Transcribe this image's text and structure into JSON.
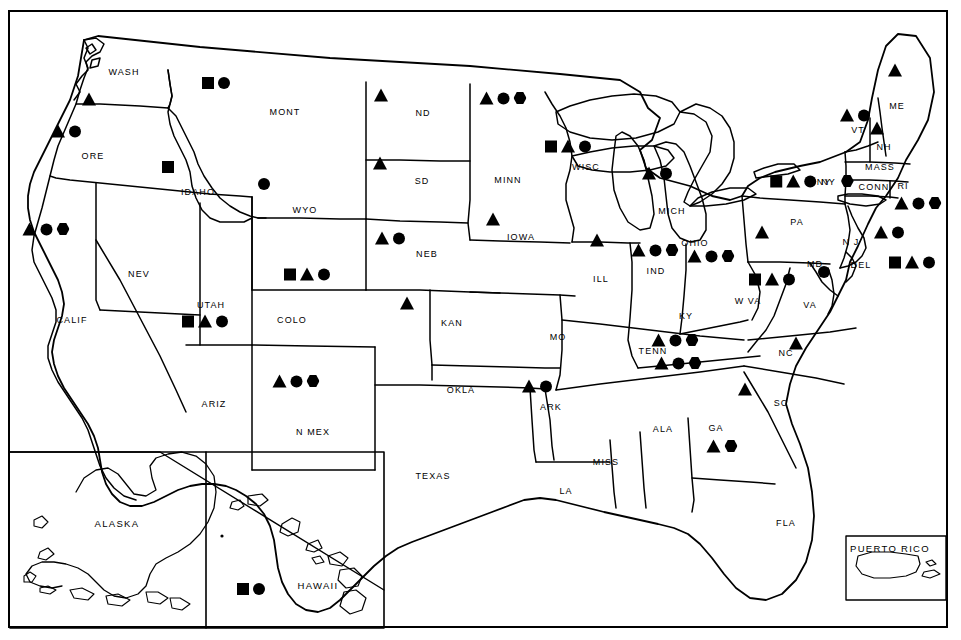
{
  "map": {
    "title": "United States Map with State Symbol Markers",
    "legend_symbols": [
      "square",
      "triangle",
      "circle",
      "hexagon"
    ],
    "frame_color": "#000000",
    "symbol_color": "#000000",
    "background_color": "#ffffff"
  },
  "insets": [
    {
      "name": "alaska",
      "label": "ALASKA"
    },
    {
      "name": "hawaii",
      "label": "HAWAII"
    },
    {
      "name": "puerto-rico",
      "label": "PUERTO RICO"
    }
  ],
  "states": [
    {
      "code": "WASH",
      "label": "WASH",
      "lx": 124,
      "ly": 72,
      "symbols": [
        "triangle"
      ],
      "sx": 89,
      "sy": 99
    },
    {
      "code": "ORE",
      "label": "ORE",
      "lx": 93,
      "ly": 156,
      "symbols": [
        "triangle",
        "circle"
      ],
      "sx": 66,
      "sy": 131
    },
    {
      "code": "IDAHO",
      "label": "IDAHO",
      "lx": 198,
      "ly": 192,
      "symbols": [
        "square"
      ],
      "sx": 168,
      "sy": 167
    },
    {
      "code": "MONT",
      "label": "MONT",
      "lx": 285,
      "ly": 112,
      "symbols": [
        "square",
        "circle"
      ],
      "sx": 216,
      "sy": 83
    },
    {
      "code": "WYO",
      "label": "WYO",
      "lx": 305,
      "ly": 210,
      "symbols": [
        "circle"
      ],
      "sx": 264,
      "sy": 184
    },
    {
      "code": "ND",
      "label": "ND",
      "lx": 423,
      "ly": 113,
      "symbols": [
        "triangle"
      ],
      "sx": 381,
      "sy": 95
    },
    {
      "code": "SD",
      "label": "SD",
      "lx": 422,
      "ly": 181,
      "symbols": [
        "triangle"
      ],
      "sx": 380,
      "sy": 163
    },
    {
      "code": "NEB",
      "label": "NEB",
      "lx": 427,
      "ly": 254,
      "symbols": [
        "triangle",
        "circle"
      ],
      "sx": 390,
      "sy": 238
    },
    {
      "code": "MINN",
      "label": "MINN",
      "lx": 508,
      "ly": 180,
      "symbols": [
        "triangle",
        "circle",
        "hexagon"
      ],
      "sx": 503,
      "sy": 98
    },
    {
      "code": "IOWA",
      "label": "IOWA",
      "lx": 521,
      "ly": 237,
      "symbols": [
        "triangle"
      ],
      "sx": 493,
      "sy": 219
    },
    {
      "code": "WISC",
      "label": "WISC",
      "lx": 586,
      "ly": 167,
      "symbols": [
        "square",
        "triangle",
        "circle"
      ],
      "sx": 568,
      "sy": 146
    },
    {
      "code": "MICH",
      "label": "MICH",
      "lx": 672,
      "ly": 211,
      "symbols": [
        "triangle",
        "circle"
      ],
      "sx": 657,
      "sy": 173
    },
    {
      "code": "ILL",
      "label": "ILL",
      "lx": 601,
      "ly": 279,
      "symbols": [
        "triangle"
      ],
      "sx": 597,
      "sy": 240
    },
    {
      "code": "IND",
      "label": "IND",
      "lx": 656,
      "ly": 271,
      "symbols": [
        "triangle",
        "circle",
        "hexagon"
      ],
      "sx": 655,
      "sy": 250
    },
    {
      "code": "OHIO",
      "label": "OHIO",
      "lx": 695,
      "ly": 243,
      "symbols": [
        "triangle",
        "circle",
        "hexagon"
      ],
      "sx": 711,
      "sy": 256
    },
    {
      "code": "KY",
      "label": "KY",
      "lx": 686,
      "ly": 316,
      "symbols": [
        "triangle",
        "circle",
        "hexagon"
      ],
      "sx": 675,
      "sy": 340
    },
    {
      "code": "TENN",
      "label": "TENN",
      "lx": 653,
      "ly": 351,
      "symbols": [
        "triangle",
        "circle",
        "hexagon"
      ],
      "sx": 678,
      "sy": 363
    },
    {
      "code": "MO",
      "label": "MO",
      "lx": 558,
      "ly": 337,
      "symbols": [],
      "sx": 0,
      "sy": 0
    },
    {
      "code": "KAN",
      "label": "KAN",
      "lx": 452,
      "ly": 323,
      "symbols": [
        "triangle"
      ],
      "sx": 407,
      "sy": 303
    },
    {
      "code": "COLO",
      "label": "COLO",
      "lx": 292,
      "ly": 320,
      "symbols": [
        "square",
        "triangle",
        "circle"
      ],
      "sx": 307,
      "sy": 274
    },
    {
      "code": "UTAH",
      "label": "UTAH",
      "lx": 211,
      "ly": 305,
      "symbols": [
        "square",
        "triangle",
        "circle"
      ],
      "sx": 205,
      "sy": 321
    },
    {
      "code": "NEV",
      "label": "NEV",
      "lx": 139,
      "ly": 274,
      "symbols": [],
      "sx": 0,
      "sy": 0
    },
    {
      "code": "CALIF",
      "label": "CALIF",
      "lx": 72,
      "ly": 320,
      "symbols": [
        "triangle",
        "circle",
        "hexagon"
      ],
      "sx": 46,
      "sy": 229
    },
    {
      "code": "ARIZ",
      "label": "ARIZ",
      "lx": 214,
      "ly": 404,
      "symbols": [],
      "sx": 0,
      "sy": 0
    },
    {
      "code": "N MEX",
      "label": "N MEX",
      "lx": 313,
      "ly": 432,
      "symbols": [
        "triangle",
        "circle",
        "hexagon"
      ],
      "sx": 296,
      "sy": 381
    },
    {
      "code": "OKLA",
      "label": "OKLA",
      "lx": 461,
      "ly": 390,
      "symbols": [],
      "sx": 0,
      "sy": 0
    },
    {
      "code": "TEXAS",
      "label": "TEXAS",
      "lx": 433,
      "ly": 476,
      "symbols": [],
      "sx": 0,
      "sy": 0
    },
    {
      "code": "ARK",
      "label": "ARK",
      "lx": 551,
      "ly": 407,
      "symbols": [
        "triangle",
        "circle"
      ],
      "sx": 537,
      "sy": 386
    },
    {
      "code": "LA",
      "label": "LA",
      "lx": 566,
      "ly": 491,
      "symbols": [],
      "sx": 0,
      "sy": 0
    },
    {
      "code": "MISS",
      "label": "MISS",
      "lx": 606,
      "ly": 462,
      "symbols": [],
      "sx": 0,
      "sy": 0
    },
    {
      "code": "ALA",
      "label": "ALA",
      "lx": 663,
      "ly": 429,
      "symbols": [],
      "sx": 0,
      "sy": 0
    },
    {
      "code": "GA",
      "label": "GA",
      "lx": 716,
      "ly": 428,
      "symbols": [
        "triangle",
        "hexagon"
      ],
      "sx": 722,
      "sy": 446
    },
    {
      "code": "FLA",
      "label": "FLA",
      "lx": 786,
      "ly": 523,
      "symbols": [],
      "sx": 0,
      "sy": 0
    },
    {
      "code": "SC",
      "label": "SC",
      "lx": 781,
      "ly": 403,
      "symbols": [
        "triangle"
      ],
      "sx": 745,
      "sy": 389
    },
    {
      "code": "NC",
      "label": "NC",
      "lx": 786,
      "ly": 353,
      "symbols": [
        "triangle"
      ],
      "sx": 796,
      "sy": 343
    },
    {
      "code": "VA",
      "label": "VA",
      "lx": 810,
      "ly": 305,
      "symbols": [],
      "sx": 0,
      "sy": 0
    },
    {
      "code": "W VA",
      "label": "W VA",
      "lx": 748,
      "ly": 301,
      "symbols": [
        "square",
        "triangle",
        "circle"
      ],
      "sx": 772,
      "sy": 279
    },
    {
      "code": "MD",
      "label": "MD",
      "lx": 815,
      "ly": 264,
      "symbols": [
        "circle"
      ],
      "sx": 824,
      "sy": 272
    },
    {
      "code": "DEL",
      "label": "DEL",
      "lx": 861,
      "ly": 265,
      "symbols": [
        "square",
        "triangle",
        "circle"
      ],
      "sx": 912,
      "sy": 262
    },
    {
      "code": "N J",
      "label": "N J",
      "lx": 851,
      "ly": 242,
      "symbols": [
        "triangle",
        "circle"
      ],
      "sx": 889,
      "sy": 232
    },
    {
      "code": "PA",
      "label": "PA",
      "lx": 797,
      "ly": 222,
      "symbols": [
        "triangle"
      ],
      "sx": 762,
      "sy": 232
    },
    {
      "code": "NY",
      "label": "NY",
      "lx": 824,
      "ly": 182,
      "symbols": [
        "square",
        "triangle",
        "circle",
        "label-ny",
        "hexagon"
      ],
      "sx": 812,
      "sy": 181
    },
    {
      "code": "CONN",
      "label": "CONN",
      "lx": 874,
      "ly": 187,
      "symbols": [],
      "sx": 0,
      "sy": 0
    },
    {
      "code": "MASS",
      "label": "MASS",
      "lx": 880,
      "ly": 167,
      "symbols": [
        "triangle",
        "circle",
        "hexagon"
      ],
      "sx": 918,
      "sy": 203
    },
    {
      "code": "RI",
      "label": "RI",
      "lx": 903,
      "ly": 186,
      "symbols": [],
      "sx": 0,
      "sy": 0
    },
    {
      "code": "VT",
      "label": "VT",
      "lx": 858,
      "ly": 130,
      "symbols": [
        "triangle",
        "circle"
      ],
      "sx": 855,
      "sy": 115
    },
    {
      "code": "NH",
      "label": "NH",
      "lx": 884,
      "ly": 147,
      "symbols": [
        "triangle"
      ],
      "sx": 877,
      "sy": 128
    },
    {
      "code": "ME",
      "label": "ME",
      "lx": 897,
      "ly": 106,
      "symbols": [
        "triangle"
      ],
      "sx": 895,
      "sy": 70
    },
    {
      "code": "ALASKA",
      "label": "ALASKA",
      "lx": 117,
      "ly": 523,
      "symbols": [],
      "sx": 0,
      "sy": 0
    },
    {
      "code": "HAWAII",
      "label": "HAWAII",
      "lx": 318,
      "ly": 585,
      "symbols": [
        "square",
        "circle"
      ],
      "sx": 251,
      "sy": 589
    },
    {
      "code": "PUERTO RICO",
      "label": "PUERTO RICO",
      "lx": 890,
      "ly": 548,
      "symbols": [],
      "sx": 0,
      "sy": 0
    }
  ]
}
